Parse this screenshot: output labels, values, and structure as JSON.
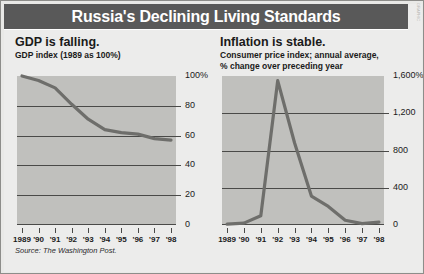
{
  "header": {
    "title": "Russia's Declining Living Standards",
    "side_credit": "GRAPHIC"
  },
  "source": "Source: The Washington Post.",
  "colors": {
    "titlebar_bg": "#595959",
    "title_text": "#ffffff",
    "plot_bg": "#c0c0bd",
    "series_line": "#6e6e6b",
    "gridline": "#4a4a48",
    "page_bg": "#ececeb"
  },
  "panels": [
    {
      "id": "gdp",
      "title": "GDP is falling.",
      "subtitle_lines": [
        "GDP index (1989 as 100%)"
      ]
    },
    {
      "id": "inflation",
      "title": "Inflation is stable.",
      "subtitle_lines": [
        "Consumer price index; annual average,",
        "% change over preceding year"
      ]
    }
  ],
  "chart_data": [
    {
      "type": "line",
      "title": "GDP is falling.",
      "subtitle": "GDP index (1989 as 100%)",
      "xlabel": "",
      "ylabel": "",
      "x": [
        "1989",
        "'90",
        "'91",
        "'92",
        "'93",
        "'94",
        "'95",
        "'96",
        "'97",
        "'98"
      ],
      "values": [
        100,
        97,
        92,
        81,
        71,
        64,
        62,
        61,
        58,
        57
      ],
      "ylim": [
        0,
        100
      ],
      "yticks": [
        0,
        20,
        40,
        60,
        80,
        100
      ],
      "ytick_labels": [
        "0",
        "20",
        "40",
        "60",
        "80",
        "100%"
      ],
      "grid": true,
      "legend": "none"
    },
    {
      "type": "line",
      "title": "Inflation is stable.",
      "subtitle": "Consumer price index; annual average, % change over preceding year",
      "xlabel": "",
      "ylabel": "",
      "x": [
        "1989",
        "'90",
        "'91",
        "'92",
        "'93",
        "'94",
        "'95",
        "'96",
        "'97",
        "'98"
      ],
      "values": [
        10,
        20,
        100,
        1550,
        880,
        310,
        200,
        50,
        15,
        30
      ],
      "ylim": [
        0,
        1600
      ],
      "yticks": [
        0,
        400,
        800,
        1200,
        1600
      ],
      "ytick_labels": [
        "0",
        "400",
        "800",
        "1,200",
        "1,600%"
      ],
      "grid": true,
      "legend": "none"
    }
  ]
}
